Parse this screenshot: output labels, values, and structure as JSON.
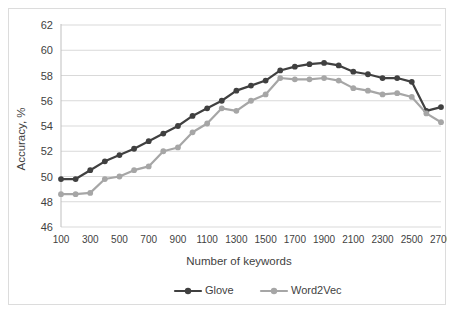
{
  "chart_data": {
    "type": "line",
    "title": "",
    "xlabel": "Number of keywords",
    "ylabel": "Accuracy, %",
    "xlim": [
      100,
      2700
    ],
    "ylim": [
      46,
      62
    ],
    "yticks": [
      46,
      48,
      50,
      52,
      54,
      56,
      58,
      60,
      62
    ],
    "xticks": [
      100,
      300,
      500,
      700,
      900,
      1100,
      1300,
      1500,
      1700,
      1900,
      2100,
      2300,
      2500,
      2700
    ],
    "x": [
      100,
      200,
      300,
      400,
      500,
      600,
      700,
      800,
      900,
      1000,
      1100,
      1200,
      1300,
      1400,
      1500,
      1600,
      1700,
      1800,
      1900,
      2000,
      2100,
      2200,
      2300,
      2400,
      2500,
      2600,
      2700
    ],
    "grid": true,
    "legend_position": "bottom",
    "series": [
      {
        "name": "Glove",
        "color": "#404040",
        "values": [
          49.8,
          49.8,
          50.5,
          51.2,
          51.7,
          52.2,
          52.8,
          53.4,
          54.0,
          54.8,
          55.4,
          56.0,
          56.8,
          57.2,
          57.6,
          58.4,
          58.7,
          58.9,
          59.0,
          58.8,
          58.3,
          58.1,
          57.8,
          57.8,
          57.5,
          55.2,
          55.5
        ]
      },
      {
        "name": "Word2Vec",
        "color": "#a6a6a6",
        "values": [
          48.6,
          48.6,
          48.7,
          49.8,
          50.0,
          50.5,
          50.8,
          52.0,
          52.3,
          53.5,
          54.2,
          55.4,
          55.2,
          56.0,
          56.5,
          57.8,
          57.7,
          57.7,
          57.8,
          57.6,
          57.0,
          56.8,
          56.5,
          56.6,
          56.3,
          55.0,
          54.3
        ]
      }
    ]
  },
  "legend": {
    "items": [
      {
        "label": "Glove",
        "color": "#404040"
      },
      {
        "label": "Word2Vec",
        "color": "#a6a6a6"
      }
    ]
  }
}
